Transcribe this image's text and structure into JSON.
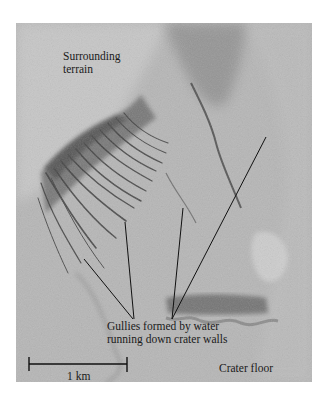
{
  "figure": {
    "labels": {
      "surrounding_terrain": [
        "Surrounding",
        "terrain"
      ],
      "gullies": [
        "Gullies formed by water",
        "running down crater walls"
      ],
      "crater_floor": "Crater floor"
    },
    "scale_bar": {
      "label": "1 km",
      "value": 1,
      "unit": "km"
    },
    "colors": {
      "background": "#ffffff",
      "terrain_base": "#b4b4b4",
      "terrain_light": "#cfcfcf",
      "gully_dark": "#3a3a3a",
      "leader_line": "#111111",
      "text": "#1a1a1a"
    }
  }
}
